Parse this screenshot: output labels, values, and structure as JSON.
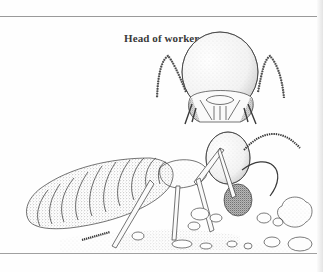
{
  "figure": {
    "caption": "Head of worker",
    "parts": [
      "head-detail",
      "body",
      "soil-pellets"
    ]
  },
  "colors": {
    "ink": "#3a3a3a",
    "stipple": "#8a8a8a",
    "rule": "#9a9a9a",
    "background": "#fefefe"
  }
}
